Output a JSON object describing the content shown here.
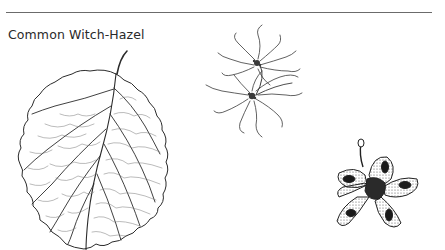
{
  "header": {
    "title": "Common Witch-Hazel"
  },
  "illustrations": [
    {
      "name": "leaf",
      "description": "Line drawing of an oval leaf with wavy toothed margin and pinnate veins"
    },
    {
      "name": "flower",
      "description": "Cluster of flowers with long thin ribbon-like petals"
    },
    {
      "name": "seed-pod",
      "description": "Stippled drawing of an opened woody seed capsule"
    }
  ],
  "colors": {
    "ink": "#2a2a2a",
    "rule": "#6b6b6b",
    "background": "#ffffff"
  }
}
